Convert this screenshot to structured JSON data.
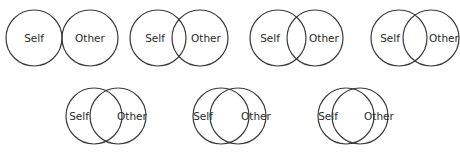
{
  "figure": {
    "stroke_color": "#3a3a3a",
    "text_color": "#2a2a2a",
    "radius": 28,
    "diagrams": [
      {
        "index": 1,
        "self_label": "Self",
        "other_label": "Other",
        "self_cx": 34,
        "other_cx": 90,
        "cy": 38,
        "self_label_x": 34,
        "other_label_x": 90
      },
      {
        "index": 2,
        "self_label": "Self",
        "other_label": "Other",
        "self_cx": 158,
        "other_cx": 200,
        "cy": 38,
        "self_label_x": 155,
        "other_label_x": 206
      },
      {
        "index": 3,
        "self_label": "Self",
        "other_label": "Other",
        "self_cx": 278,
        "other_cx": 315,
        "cy": 38,
        "self_label_x": 270,
        "other_label_x": 324
      },
      {
        "index": 4,
        "self_label": "Self",
        "other_label": "Other",
        "self_cx": 399,
        "other_cx": 431,
        "cy": 38,
        "self_label_x": 390,
        "other_label_x": 444
      },
      {
        "index": 5,
        "self_label": "Self",
        "other_label": "Other",
        "self_cx": 94,
        "other_cx": 118,
        "cy": 116,
        "self_label_x": 79,
        "other_label_x": 132
      },
      {
        "index": 6,
        "self_label": "Self",
        "other_label": "Other",
        "self_cx": 221,
        "other_cx": 238,
        "cy": 116,
        "self_label_x": 203,
        "other_label_x": 256
      },
      {
        "index": 7,
        "self_label": "Self",
        "other_label": "Other",
        "self_cx": 346,
        "other_cx": 360,
        "cy": 116,
        "self_label_x": 328,
        "other_label_x": 379
      }
    ]
  }
}
